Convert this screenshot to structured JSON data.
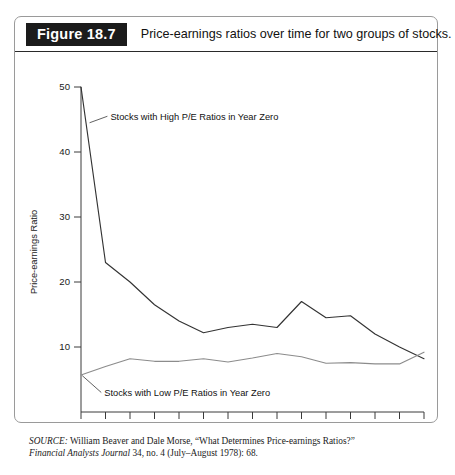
{
  "figure": {
    "tag": "Figure 18.7",
    "caption": "Price-earnings ratios over time for two groups of stocks."
  },
  "source": {
    "lead": "SOURCE:",
    "authors_and_title": " William Beaver and Dale Morse, “What Determines Price-earnings Ratios?”",
    "journal": "Financial Analysts Journal",
    "citation": " 34, no. 4 (July–August 1978): 68."
  },
  "chart_data": {
    "type": "line",
    "title": "Price-earnings ratios over time for two groups of stocks.",
    "xlabel": "Year Since Selection of Stocks in Group",
    "ylabel": "Price-earnings Ratio",
    "x": [
      0,
      1,
      2,
      3,
      4,
      5,
      6,
      7,
      8,
      9,
      10,
      11,
      12,
      13,
      14
    ],
    "xtick_labels": [
      "0",
      "1",
      "2",
      "3",
      "4",
      "5",
      "6",
      "7",
      "8",
      "9",
      "10",
      "11",
      "12",
      "13",
      "14"
    ],
    "ytick_labels": [
      "10",
      "20",
      "30",
      "40",
      "50"
    ],
    "yticks": [
      10,
      20,
      30,
      40,
      50
    ],
    "xlim": [
      0,
      14
    ],
    "ylim": [
      0,
      50
    ],
    "grid": false,
    "legend_position": "inline-annotations",
    "series": [
      {
        "name": "Stocks with High P/E Ratios in Year Zero",
        "color": "#333333",
        "values": [
          50,
          23,
          20,
          16.5,
          14,
          12.2,
          13,
          13.5,
          13,
          17,
          14.5,
          14.8,
          12,
          10,
          8.2
        ]
      },
      {
        "name": "Stocks with Low P/E Ratios in Year Zero",
        "color": "#8c8c8c",
        "values": [
          5.7,
          7,
          8.2,
          7.8,
          7.8,
          8.2,
          7.7,
          8.3,
          9,
          8.5,
          7.5,
          7.6,
          7.4,
          7.4,
          9.2
        ]
      }
    ],
    "annotations": [
      {
        "text": "Stocks with High P/E Ratios in Year Zero",
        "target_x": 0.35,
        "target_y": 44.5,
        "text_x": 1.2,
        "text_y": 45.5
      },
      {
        "text": "Stocks with Low P/E Ratios in Year Zero",
        "target_x": 0.05,
        "target_y": 5.6,
        "text_x": 0.95,
        "text_y": 3.0
      }
    ]
  }
}
